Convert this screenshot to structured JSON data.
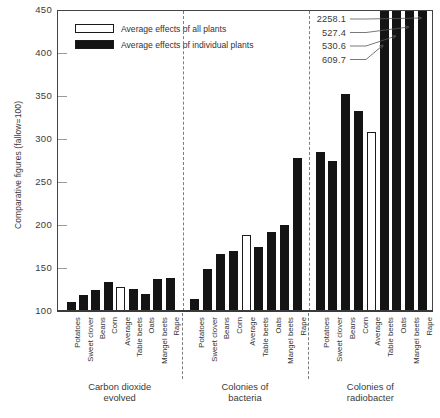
{
  "chart_data": {
    "type": "bar",
    "title": "",
    "xlabel": "",
    "ylabel": "Comparative figures (fallow=100)",
    "ylim": [
      100,
      450
    ],
    "yticks": [
      100,
      150,
      200,
      250,
      300,
      350,
      400,
      450
    ],
    "grid": false,
    "legend_position": "top-left",
    "baseline": 100,
    "legend": [
      {
        "key": "all_plants",
        "label": "Average effects of all plants",
        "style": "hollow"
      },
      {
        "key": "individual_plants",
        "label": "Average effects of individual plants",
        "style": "filled"
      }
    ],
    "categories": [
      "Potatoes",
      "Sweet clover",
      "Beans",
      "Corn",
      "Average",
      "Table beets",
      "Oats",
      "Mangel beets",
      "Rape"
    ],
    "groups": [
      {
        "name": "Carbon dioxide\nevolved",
        "values": [
          110,
          119,
          124,
          134,
          128,
          126,
          120,
          137,
          138
        ],
        "styles": [
          "filled",
          "filled",
          "filled",
          "filled",
          "hollow",
          "filled",
          "filled",
          "filled",
          "filled"
        ],
        "offscale": [
          false,
          false,
          false,
          false,
          false,
          false,
          false,
          false,
          false
        ],
        "offscale_values": [
          null,
          null,
          null,
          null,
          null,
          null,
          null,
          null,
          null
        ]
      },
      {
        "name": "Colonies of\nbacteria",
        "values": [
          114,
          149,
          166,
          170,
          188,
          174,
          192,
          200,
          278
        ],
        "styles": [
          "filled",
          "filled",
          "filled",
          "filled",
          "hollow",
          "filled",
          "filled",
          "filled",
          "filled"
        ],
        "offscale": [
          false,
          false,
          false,
          false,
          false,
          false,
          false,
          false,
          false
        ],
        "offscale_values": [
          null,
          null,
          null,
          null,
          null,
          null,
          null,
          null,
          null
        ]
      },
      {
        "name": "Colonies of\nradiobacter",
        "values": [
          285,
          275,
          352,
          332,
          308,
          450,
          450,
          450,
          450
        ],
        "styles": [
          "filled",
          "filled",
          "filled",
          "filled",
          "hollow",
          "filled",
          "filled",
          "filled",
          "filled"
        ],
        "offscale": [
          false,
          false,
          false,
          false,
          false,
          true,
          true,
          true,
          true
        ],
        "offscale_values": [
          null,
          null,
          null,
          null,
          null,
          609.7,
          530.6,
          527.4,
          2258.1
        ]
      }
    ],
    "annotations": [
      {
        "value": "2258.1",
        "target_group": 2,
        "target_index": 8
      },
      {
        "value": "527.4",
        "target_group": 2,
        "target_index": 7
      },
      {
        "value": "530.6",
        "target_group": 2,
        "target_index": 6
      },
      {
        "value": "609.7",
        "target_group": 2,
        "target_index": 5
      }
    ]
  }
}
